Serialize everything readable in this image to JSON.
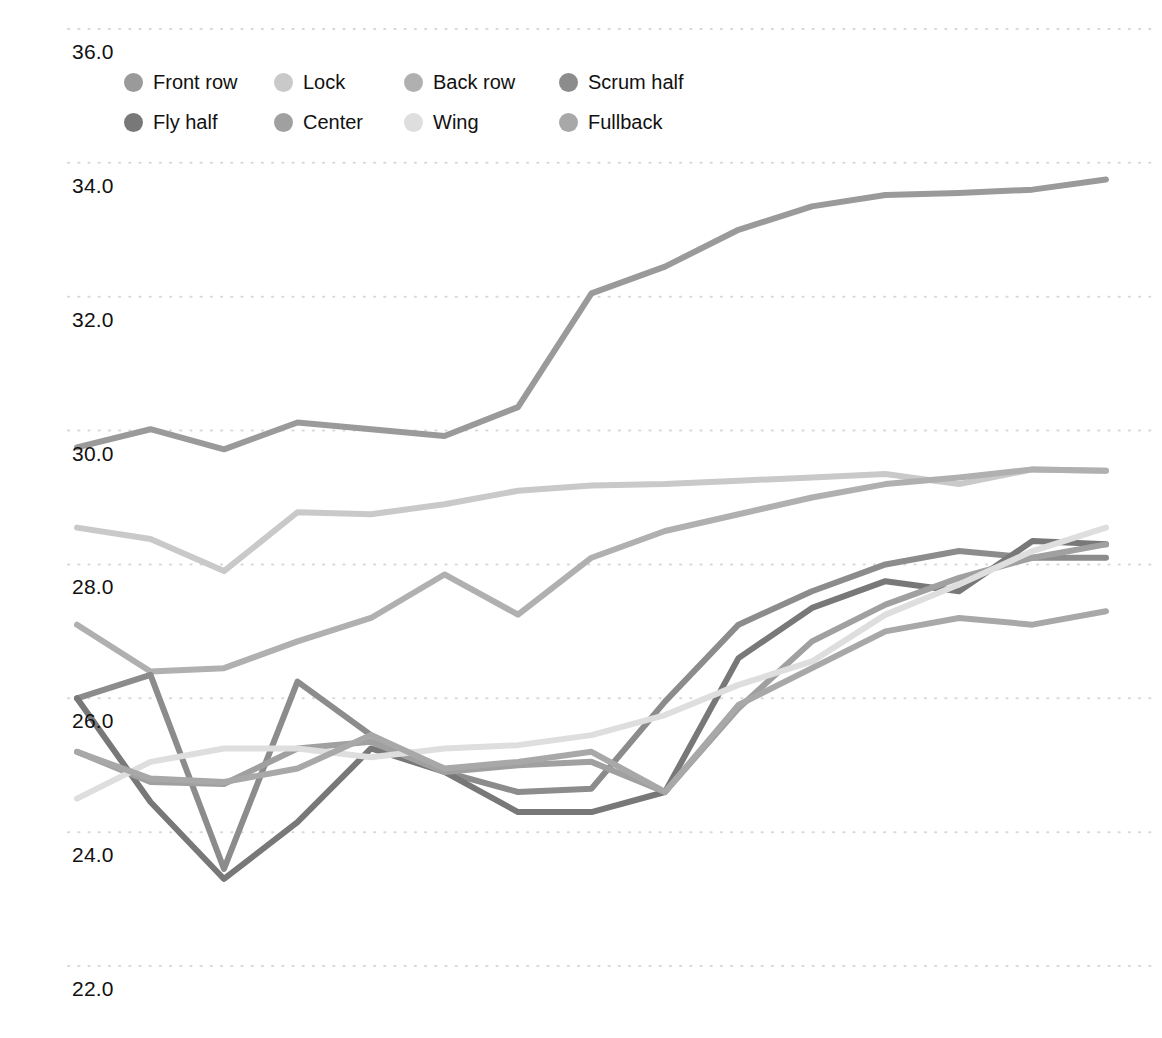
{
  "chart_data": {
    "type": "line",
    "title": "",
    "xlabel": "",
    "ylabel": "Body mass index (BMI)",
    "ylim": [
      21.3,
      36.6
    ],
    "yticks": [
      22.0,
      24.0,
      26.0,
      28.0,
      30.0,
      32.0,
      34.0,
      36.0
    ],
    "ytick_labels": [
      "22.0",
      "24.0",
      "26.0",
      "28.0",
      "30.0",
      "32.0",
      "34.0",
      "36.0"
    ],
    "grid": "dotted-horizontal",
    "xtick_labels": [],
    "legend_position": "top-left",
    "x": [
      1,
      2,
      3,
      4,
      5,
      6,
      7,
      8,
      9,
      10,
      11,
      12,
      13,
      14,
      15
    ],
    "series": [
      {
        "name": "Front row",
        "color": "#9a9a9a",
        "values": [
          29.75,
          30.02,
          29.72,
          30.12,
          30.02,
          29.92,
          30.35,
          32.05,
          32.45,
          33.0,
          33.35,
          33.52,
          33.55,
          33.6,
          33.75
        ]
      },
      {
        "name": "Lock",
        "color": "#c9c9c9",
        "values": [
          28.55,
          28.38,
          27.9,
          28.78,
          28.75,
          28.9,
          29.1,
          29.18,
          29.2,
          29.25,
          29.3,
          29.35,
          29.2,
          29.42,
          29.4
        ]
      },
      {
        "name": "Back row",
        "color": "#b0b0b0",
        "values": [
          27.1,
          26.4,
          26.45,
          26.85,
          27.2,
          27.85,
          27.25,
          28.1,
          28.5,
          28.75,
          29.0,
          29.2,
          29.3,
          29.42,
          29.4
        ]
      },
      {
        "name": "Scrum half",
        "color": "#8c8c8c",
        "values": [
          26.0,
          26.35,
          23.45,
          26.25,
          25.45,
          24.9,
          24.6,
          24.65,
          25.95,
          27.1,
          27.6,
          28.0,
          28.2,
          28.1,
          28.1
        ]
      },
      {
        "name": "Fly half",
        "color": "#787878",
        "values": [
          26.0,
          24.45,
          23.3,
          24.15,
          25.25,
          24.9,
          24.3,
          24.3,
          24.6,
          26.6,
          27.35,
          27.75,
          27.6,
          28.35,
          28.3
        ]
      },
      {
        "name": "Center",
        "color": "#a0a0a0",
        "values": [
          25.2,
          24.75,
          24.72,
          25.25,
          25.35,
          24.9,
          25.0,
          25.05,
          24.6,
          25.85,
          26.85,
          27.4,
          27.8,
          28.1,
          28.3
        ]
      },
      {
        "name": "Wing",
        "color": "#dedede",
        "values": [
          24.5,
          25.05,
          25.25,
          25.25,
          25.12,
          25.25,
          25.3,
          25.45,
          25.75,
          26.2,
          26.55,
          27.25,
          27.7,
          28.2,
          28.55
        ]
      },
      {
        "name": "Fullback",
        "color": "#a8a8a8",
        "values": [
          25.2,
          24.8,
          24.75,
          24.95,
          25.45,
          24.95,
          25.05,
          25.2,
          24.6,
          25.9,
          26.45,
          27.0,
          27.2,
          27.1,
          27.3
        ]
      }
    ]
  },
  "legend": {
    "items": [
      {
        "label": "Front row",
        "color": "#9a9a9a"
      },
      {
        "label": "Lock",
        "color": "#c9c9c9"
      },
      {
        "label": "Back row",
        "color": "#b0b0b0"
      },
      {
        "label": "Scrum half",
        "color": "#8c8c8c"
      },
      {
        "label": "Fly half",
        "color": "#787878"
      },
      {
        "label": "Center",
        "color": "#a0a0a0"
      },
      {
        "label": "Wing",
        "color": "#dedede"
      },
      {
        "label": "Fullback",
        "color": "#a8a8a8"
      }
    ]
  },
  "style": {
    "grid_color": "#d8d8d8",
    "text_color": "#111111",
    "background": "#ffffff"
  }
}
